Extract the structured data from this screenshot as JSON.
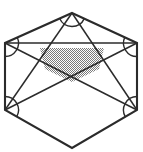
{
  "figure": {
    "kind": "geometry-diagram",
    "background_color": "#ffffff",
    "stroke_color": "#2b2b2b",
    "shade_color": "#808080",
    "shade_pattern": "50% checkerboard dither",
    "canvas": {
      "width": 143,
      "height": 152
    },
    "hexagon": {
      "name": "outer-hexagon",
      "sides": 6,
      "vertices": [
        {
          "label": "top",
          "x": 72,
          "y": 13
        },
        {
          "label": "upper-right",
          "x": 137,
          "y": 43
        },
        {
          "label": "lower-right",
          "x": 137,
          "y": 110
        },
        {
          "label": "bottom",
          "x": 72,
          "y": 148
        },
        {
          "label": "lower-left",
          "x": 5,
          "y": 110
        },
        {
          "label": "upper-left",
          "x": 5,
          "y": 43
        }
      ]
    },
    "chords": [
      {
        "name": "chord-upper-left-to-lower-right",
        "from": "upper-left",
        "to": "lower-right"
      },
      {
        "name": "chord-upper-right-to-lower-left",
        "from": "upper-right",
        "to": "lower-left"
      },
      {
        "name": "chord-top-to-lower-left",
        "from": "top",
        "to": "lower-left"
      },
      {
        "name": "chord-top-to-lower-right",
        "from": "top",
        "to": "lower-right"
      },
      {
        "name": "chord-upper-left-to-upper-right",
        "from": "upper-left",
        "to": "upper-right"
      }
    ],
    "intersections": [
      {
        "name": "center-crossing",
        "x": 72,
        "y": 82
      },
      {
        "name": "left-crossing",
        "x": 45,
        "y": 69
      },
      {
        "name": "right-crossing",
        "x": 99,
        "y": 69
      }
    ],
    "shaded_region": {
      "name": "shaded-pentagon",
      "fill": "#808080",
      "vertices": [
        {
          "x": 40,
          "y": 48
        },
        {
          "x": 104,
          "y": 48
        },
        {
          "x": 99,
          "y": 69
        },
        {
          "x": 72,
          "y": 82
        },
        {
          "x": 45,
          "y": 69
        }
      ]
    },
    "angle_marks": [
      {
        "name": "angle-arc-top",
        "at": "top",
        "x": 72,
        "y": 13
      },
      {
        "name": "angle-arc-upper-left",
        "at": "upper-left",
        "x": 5,
        "y": 43
      },
      {
        "name": "angle-arc-upper-right",
        "at": "upper-right",
        "x": 137,
        "y": 43
      },
      {
        "name": "angle-arc-lower-left",
        "at": "lower-left",
        "x": 5,
        "y": 110
      },
      {
        "name": "angle-arc-lower-right",
        "at": "lower-right",
        "x": 137,
        "y": 110
      }
    ],
    "labels": []
  }
}
